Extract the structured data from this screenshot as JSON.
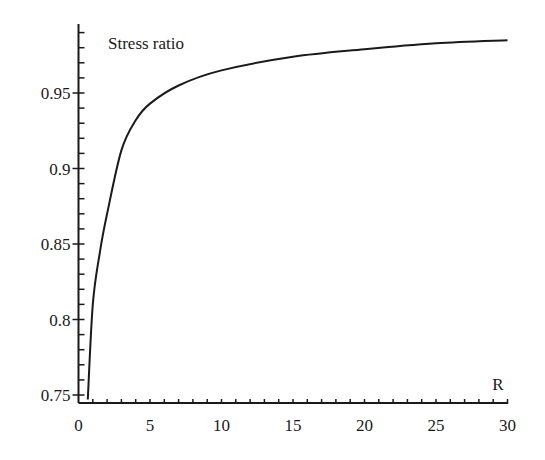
{
  "chart_data": {
    "type": "line",
    "title": "",
    "ylabel": "Stress ratio",
    "xlabel": "R",
    "xlim": [
      0,
      30
    ],
    "ylim": [
      0.745,
      0.996
    ],
    "grid": false,
    "legend": null,
    "x_ticks": [
      0,
      5,
      10,
      15,
      20,
      25,
      30
    ],
    "x_tick_labels": [
      "0",
      "5",
      "10",
      "15",
      "20",
      "25",
      "30"
    ],
    "y_ticks": [
      0.75,
      0.8,
      0.85,
      0.9,
      0.95
    ],
    "y_tick_labels": [
      "0.75",
      "0.8",
      "0.85",
      "0.9",
      "0.95"
    ],
    "series": [
      {
        "name": "Stress ratio",
        "color": "#1a1a1a",
        "x": [
          0.65,
          1.0,
          1.5,
          2,
          3,
          4,
          5,
          7,
          10,
          15,
          20,
          25,
          30
        ],
        "y": [
          0.747,
          0.81,
          0.845,
          0.87,
          0.912,
          0.932,
          0.943,
          0.955,
          0.965,
          0.974,
          0.979,
          0.983,
          0.985
        ]
      }
    ]
  }
}
